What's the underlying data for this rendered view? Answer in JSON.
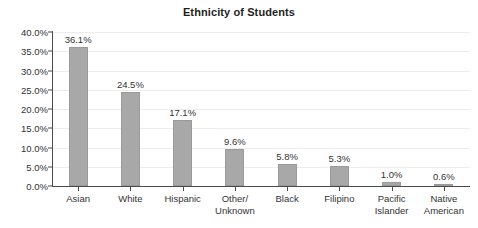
{
  "chart_data": {
    "type": "bar",
    "title": "Ethnicity of Students",
    "xlabel": "",
    "ylabel": "",
    "ylim": [
      0,
      40
    ],
    "ytick_labels": [
      "40.0%",
      "35.0%",
      "30.0%",
      "25.0%",
      "20.0%",
      "15.0%",
      "10.0%",
      "5.0%",
      "0.0%"
    ],
    "ytick_values": [
      40,
      35,
      30,
      25,
      20,
      15,
      10,
      5,
      0
    ],
    "grid": true,
    "legend": "none",
    "categories": [
      "Asian",
      "White",
      "Hispanic",
      "Other/ Unknown",
      "Black",
      "Filipino",
      "Pacific Islander",
      "Native American"
    ],
    "category_lines": [
      [
        "Asian"
      ],
      [
        "White"
      ],
      [
        "Hispanic"
      ],
      [
        "Other/",
        "Unknown"
      ],
      [
        "Black"
      ],
      [
        "Filipino"
      ],
      [
        "Pacific",
        "Islander"
      ],
      [
        "Native",
        "American"
      ]
    ],
    "values": [
      36.1,
      24.5,
      17.1,
      9.6,
      5.8,
      5.3,
      1.0,
      0.6
    ],
    "value_labels": [
      "36.1%",
      "24.5%",
      "17.1%",
      "9.6%",
      "5.8%",
      "5.3%",
      "1.0%",
      "0.6%"
    ],
    "bar_color": "#a8a8a8",
    "axis_color": "#4a4a4a",
    "grid_color": "#ededed",
    "background_color": "#ffffff"
  }
}
